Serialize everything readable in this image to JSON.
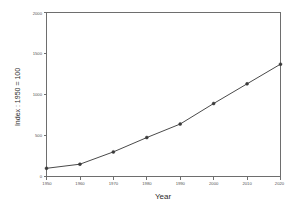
{
  "chart_data": {
    "type": "line",
    "title": "",
    "subtitle": "",
    "xlabel": "Year",
    "ylabel": "Index : 1950 = 100",
    "x": [
      1950,
      1960,
      1970,
      1980,
      1990,
      2000,
      2010,
      2020
    ],
    "values": [
      100,
      150,
      300,
      475,
      640,
      890,
      1130,
      1370
    ],
    "series": [
      {
        "name": "Index",
        "values": [
          100,
          150,
          300,
          475,
          640,
          890,
          1130,
          1370
        ]
      }
    ],
    "xlim": [
      1950,
      2020
    ],
    "ylim": [
      0,
      2000
    ],
    "xticks": [
      1950,
      1960,
      1970,
      1980,
      1990,
      2000,
      2010,
      2020
    ],
    "xtick_labels": [
      "1950",
      "1960",
      "1970",
      "1980",
      "1990",
      "2000",
      "2010",
      "2020"
    ],
    "yticks": [
      0,
      500,
      1000,
      1500,
      2000
    ],
    "ytick_labels": [
      "0",
      "500",
      "1000",
      "1500",
      "2000"
    ],
    "grid": false,
    "legend": false,
    "legend_position": "none",
    "marker": "circle",
    "line_color": "#4a4a4a",
    "marker_color": "#3a3a3a",
    "background_color": "#ffffff",
    "axis_color": "#6e6e6e"
  },
  "axis_titles": {
    "x": "Year",
    "y": "Index : 1950 = 100"
  },
  "ticks": {
    "x": [
      "1950",
      "1960",
      "1970",
      "1980",
      "1990",
      "2000",
      "2010",
      "2020"
    ],
    "y": [
      "0",
      "500",
      "1000",
      "1500",
      "2000"
    ]
  }
}
